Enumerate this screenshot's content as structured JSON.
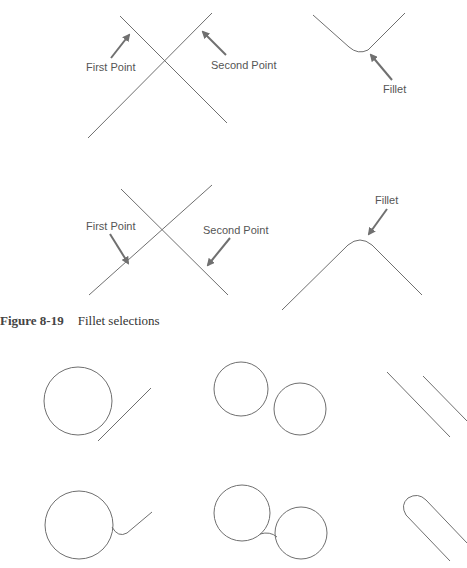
{
  "figure": {
    "number": "Figure 8-19",
    "title": "Fillet selections"
  },
  "panels": {
    "top_left": {
      "label_first": "First Point",
      "label_second": "Second Point"
    },
    "top_right": {
      "label": "Fillet"
    },
    "middle_left": {
      "label_first": "First Point",
      "label_second": "Second Point"
    },
    "middle_right": {
      "label": "Fillet"
    }
  },
  "examples": [
    {
      "before": "circle and line",
      "after": "circle filleted to line"
    },
    {
      "before": "two circles",
      "after": "two circles filleted"
    },
    {
      "before": "two parallel lines",
      "after": "parallel lines joined with semicircular fillet"
    }
  ],
  "colors": {
    "line": "#6f6f6f",
    "arrow": "#707070",
    "label": "#555555"
  }
}
